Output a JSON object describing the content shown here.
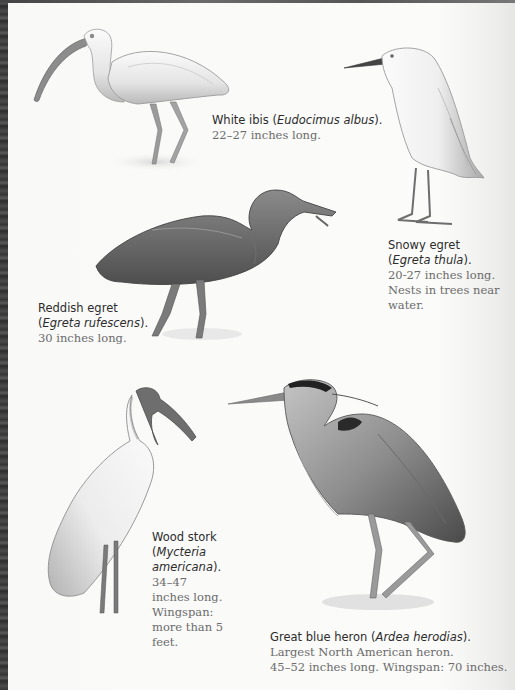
{
  "page": {
    "background": "#f6f6f5",
    "binding_color": "#3a3a3a"
  },
  "birds": [
    {
      "id": "white-ibis",
      "illustration": "white-ibis-illustration",
      "common_name": "White ibis",
      "latin_name": "Eudocimus albus",
      "details": [
        "22–27 inches long."
      ]
    },
    {
      "id": "snowy-egret",
      "illustration": "snowy-egret-illustration",
      "common_name": "Snowy egret",
      "latin_name": "Egreta thula",
      "details": [
        "20-27 inches long.",
        "Nests in trees near",
        "water."
      ]
    },
    {
      "id": "reddish-egret",
      "illustration": "reddish-egret-illustration",
      "common_name": "Reddish egret",
      "latin_name": "Egreta rufescens",
      "details": [
        "30 inches long."
      ]
    },
    {
      "id": "wood-stork",
      "illustration": "wood-stork-illustration",
      "common_name": "Wood stork",
      "latin_name_lines": [
        "Mycteria",
        "americana"
      ],
      "details": [
        "34–47",
        "inches long.",
        "Wingspan:",
        "more than 5",
        "feet."
      ]
    },
    {
      "id": "great-blue-heron",
      "illustration": "great-blue-heron-illustration",
      "common_name": "Great blue heron",
      "latin_name": "Ardea herodias",
      "details": [
        "Largest North American heron.",
        "45–52 inches long. Wingspan: 70 inches."
      ]
    }
  ],
  "punct": {
    "open": "(",
    "close": ").",
    "space": " "
  }
}
